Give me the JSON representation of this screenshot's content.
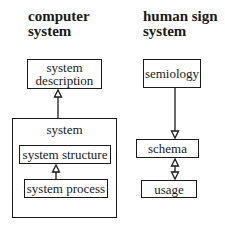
{
  "left_column": {
    "title_line1": "computer",
    "title_line2": "system",
    "description_box": {
      "line1": "system",
      "line2": "description"
    },
    "system_container": {
      "label": "system",
      "structure_box": "system structure",
      "process_box": "system process"
    }
  },
  "right_column": {
    "title_line1": "human sign",
    "title_line2": "system",
    "semiology_box": "semiology",
    "schema_box": "schema",
    "usage_box": "usage"
  },
  "colors": {
    "stroke": "#1a1a1a",
    "background": "#ffffff"
  }
}
